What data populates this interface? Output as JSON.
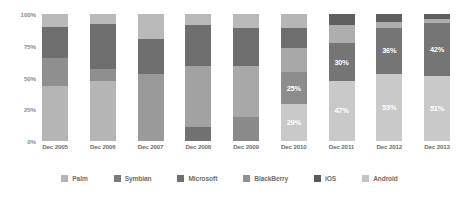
{
  "chart_data": {
    "type": "bar",
    "subtype": "stacked-100-percent",
    "title": "",
    "xlabel": "",
    "ylabel": "",
    "ylim": [
      0,
      100
    ],
    "grid": false,
    "legend_position": "bottom",
    "categories": [
      "Dec 2005",
      "Dec 2006",
      "Dec 2007",
      "Dec 2008",
      "Dec 2009",
      "Dec 2010",
      "Dec 2011",
      "Dec 2012",
      "Dec 2013"
    ],
    "y_ticks": [
      "0%",
      "25%",
      "50%",
      "75%",
      "100%"
    ],
    "y_tick_values": [
      0,
      25,
      50,
      75,
      100
    ],
    "series": [
      {
        "name": "Palm",
        "color": "#b5b5b5",
        "values": [
          26,
          17,
          11,
          8,
          5,
          2,
          0,
          0,
          0
        ]
      },
      {
        "name": "Symbian",
        "color": "#8f8f8f",
        "values": [
          17,
          25,
          27,
          23,
          17,
          9,
          4,
          2,
          1
        ]
      },
      {
        "name": "Microsoft",
        "color": "#6e6e6e",
        "values": [
          25,
          29,
          34,
          40,
          33,
          20,
          9,
          5,
          3
        ]
      },
      {
        "name": "BlackBerry",
        "color": "#9a9a9a",
        "values": [
          22,
          21,
          19,
          19,
          24,
          19,
          10,
          4,
          3
        ]
      },
      {
        "name": "iOS",
        "color": "#5a5a5a",
        "values": [
          0,
          0,
          3,
          6,
          13,
          25,
          30,
          36,
          42
        ]
      },
      {
        "name": "Android",
        "color": "#c9c9c9",
        "values": [
          10,
          8,
          6,
          4,
          8,
          29,
          47,
          53,
          51
        ]
      }
    ],
    "data_labels": [
      {
        "category": "Dec 2010",
        "series": "iOS",
        "text": "25%"
      },
      {
        "category": "Dec 2010",
        "series": "Android",
        "text": "29%"
      },
      {
        "category": "Dec 2011",
        "series": "iOS",
        "text": "30%"
      },
      {
        "category": "Dec 2011",
        "series": "Android",
        "text": "47%"
      },
      {
        "category": "Dec 2012",
        "series": "iOS",
        "text": "36%"
      },
      {
        "category": "Dec 2012",
        "series": "Android",
        "text": "53%"
      },
      {
        "category": "Dec 2013",
        "series": "iOS",
        "text": "42%"
      },
      {
        "category": "Dec 2013",
        "series": "Android",
        "text": "51%"
      }
    ],
    "bars": [
      {
        "category": "Dec 2005",
        "segments": [
          {
            "series": "Android",
            "value": 10,
            "color": "#b9b9b9",
            "label": ""
          },
          {
            "series": "Microsoft",
            "value": 25,
            "color": "#6e6e6e",
            "label": ""
          },
          {
            "series": "Symbian",
            "value": 22,
            "color": "#8f8f8f",
            "label": ""
          },
          {
            "series": "Palm",
            "value": 43,
            "color": "#b5b5b5",
            "label": ""
          }
        ]
      },
      {
        "category": "Dec 2006",
        "segments": [
          {
            "series": "Android",
            "value": 8,
            "color": "#b9b9b9",
            "label": ""
          },
          {
            "series": "Microsoft",
            "value": 35,
            "color": "#6e6e6e",
            "label": ""
          },
          {
            "series": "Symbian",
            "value": 10,
            "color": "#8f8f8f",
            "label": ""
          },
          {
            "series": "Palm",
            "value": 47,
            "color": "#b5b5b5",
            "label": ""
          }
        ]
      },
      {
        "category": "Dec 2007",
        "segments": [
          {
            "series": "Android",
            "value": 20,
            "color": "#b9b9b9",
            "label": ""
          },
          {
            "series": "Microsoft",
            "value": 27,
            "color": "#6e6e6e",
            "label": ""
          },
          {
            "series": "Symbian",
            "value": 53,
            "color": "#9a9a9a",
            "label": ""
          }
        ]
      },
      {
        "category": "Dec 2008",
        "segments": [
          {
            "series": "Android",
            "value": 9,
            "color": "#b9b9b9",
            "label": ""
          },
          {
            "series": "Microsoft",
            "value": 32,
            "color": "#6e6e6e",
            "label": ""
          },
          {
            "series": "BlackBerry",
            "value": 48,
            "color": "#a2a2a2",
            "label": ""
          },
          {
            "series": "iOS",
            "value": 11,
            "color": "#717171",
            "label": ""
          }
        ]
      },
      {
        "category": "Dec 2009",
        "segments": [
          {
            "series": "Android",
            "value": 11,
            "color": "#b9b9b9",
            "label": ""
          },
          {
            "series": "Microsoft",
            "value": 30,
            "color": "#6e6e6e",
            "label": ""
          },
          {
            "series": "BlackBerry",
            "value": 40,
            "color": "#a8a8a8",
            "label": ""
          },
          {
            "series": "iOS",
            "value": 19,
            "color": "#8a8a8a",
            "label": ""
          }
        ]
      },
      {
        "category": "Dec 2010",
        "segments": [
          {
            "series": "Symbian",
            "value": 11,
            "color": "#b6b6b6",
            "label": ""
          },
          {
            "series": "Microsoft",
            "value": 16,
            "color": "#6e6e6e",
            "label": ""
          },
          {
            "series": "BlackBerry",
            "value": 19,
            "color": "#a8a8a8",
            "label": ""
          },
          {
            "series": "iOS",
            "value": 25,
            "color": "#8d8d8d",
            "label": "25%"
          },
          {
            "series": "Android",
            "value": 29,
            "color": "#c9c9c9",
            "label": "29%"
          }
        ]
      },
      {
        "category": "Dec 2011",
        "segments": [
          {
            "series": "Microsoft",
            "value": 9,
            "color": "#5f5f5f",
            "label": ""
          },
          {
            "series": "BlackBerry",
            "value": 14,
            "color": "#aeaeae",
            "label": ""
          },
          {
            "series": "iOS",
            "value": 30,
            "color": "#757575",
            "label": "30%"
          },
          {
            "series": "Android",
            "value": 47,
            "color": "#c9c9c9",
            "label": "47%"
          }
        ]
      },
      {
        "category": "Dec 2012",
        "segments": [
          {
            "series": "Microsoft",
            "value": 6,
            "color": "#5f5f5f",
            "label": ""
          },
          {
            "series": "BlackBerry",
            "value": 5,
            "color": "#aeaeae",
            "label": ""
          },
          {
            "series": "iOS",
            "value": 36,
            "color": "#757575",
            "label": "36%"
          },
          {
            "series": "Android",
            "value": 53,
            "color": "#c9c9c9",
            "label": "53%"
          }
        ]
      },
      {
        "category": "Dec 2013",
        "segments": [
          {
            "series": "Microsoft",
            "value": 4,
            "color": "#5f5f5f",
            "label": ""
          },
          {
            "series": "BlackBerry",
            "value": 3,
            "color": "#aeaeae",
            "label": ""
          },
          {
            "series": "iOS",
            "value": 42,
            "color": "#757575",
            "label": "42%"
          },
          {
            "series": "Android",
            "value": 51,
            "color": "#c9c9c9",
            "label": "51%"
          }
        ]
      }
    ]
  },
  "legend": {
    "items": [
      {
        "label": "Palm",
        "color": "#b5b5b5"
      },
      {
        "label": "Symbian",
        "color": "#7b7b7b"
      },
      {
        "label": "Microsoft",
        "color": "#6e6e6e"
      },
      {
        "label": "BlackBerry",
        "color": "#919191"
      },
      {
        "label": "iOS",
        "color": "#5a5a5a"
      },
      {
        "label": "Android",
        "color": "#c4c4c4"
      }
    ]
  }
}
